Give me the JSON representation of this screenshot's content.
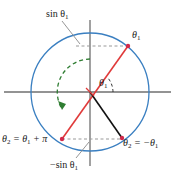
{
  "figure": {
    "kind": "unit-circle-trigonometry-diagram",
    "width": 175,
    "height": 180
  },
  "colors": {
    "circle": "#3a7fc1",
    "axis": "#6f6f6f",
    "red_line": "#e03a3a",
    "black_line": "#111111",
    "green_dashed": "#2f7d32",
    "gray_dashed": "#9a9a9a",
    "point_red": "#d12a4a",
    "text": "#1a1a1a"
  },
  "labels": {
    "sin_top": "sin θ",
    "sin_top_sub": "1",
    "theta1_top_right": "θ",
    "theta1_top_right_sub": "1",
    "theta1_center": "θ",
    "theta1_center_sub": "1",
    "theta2_bottom_left": "θ",
    "theta2_bottom_left_sub": "2",
    "theta2_bottom_left_rest": " = θ",
    "theta2_bottom_left_sub2": "1",
    "theta2_bottom_left_tail": " + π",
    "theta2_bottom_right": "θ",
    "theta2_bottom_right_sub": "2",
    "theta2_bottom_right_rest": " = −θ",
    "theta2_bottom_right_sub2": "1",
    "neg_sin_bottom": "−sin θ",
    "neg_sin_bottom_sub": "1"
  },
  "geometry": {
    "center": {
      "x": 90,
      "y": 92
    },
    "radius": 59,
    "angle1_degrees": 38,
    "points": {
      "p_theta1": {
        "x": 128,
        "y": 46,
        "color": "#d12a4a"
      },
      "p_theta1_plus_pi": {
        "x": 62,
        "y": 139,
        "color": "#d12a4a"
      },
      "p_minus_theta1": {
        "x": 122,
        "y": 138,
        "color": "#d12a4a"
      }
    },
    "axes": {
      "x_axis": {
        "x1": 4,
        "y1": 92,
        "x2": 171,
        "y2": 92
      },
      "y_axis": {
        "x1": 90,
        "y1": 20,
        "x2": 90,
        "y2": 166
      }
    },
    "sin_dashed_top": {
      "x1": 76,
      "y1": 46,
      "x2": 128,
      "y2": 46
    },
    "sin_dashed_bottom": {
      "x1": 62,
      "y1": 139,
      "x2": 122,
      "y2": 139
    },
    "green_arc": {
      "radius": 33,
      "start_degrees": 90,
      "end_degrees": 218
    },
    "angle_arc": {
      "radius": 23,
      "start_degrees": 0,
      "end_degrees": 38
    }
  },
  "annotations": {
    "leader_sin_top": {
      "x1": 62,
      "y1": 20,
      "x2": 80,
      "y2": 43
    },
    "leader_negsin_bot": {
      "x1": 74,
      "y1": 158,
      "x2": 88,
      "y2": 142
    }
  }
}
